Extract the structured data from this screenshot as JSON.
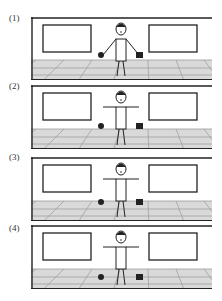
{
  "figure": {
    "panels": [
      {
        "label": "(1)",
        "top": 17,
        "height": 63,
        "labelTop": 13,
        "ballY": 38,
        "boxY": 38,
        "armsHolding": true
      },
      {
        "label": "(2)",
        "top": 85,
        "height": 64,
        "labelTop": 81,
        "ballY": 41,
        "boxY": 41,
        "armsHolding": false
      },
      {
        "label": "(3)",
        "top": 157,
        "height": 64,
        "labelTop": 152,
        "ballY": 45,
        "boxY": 45,
        "armsHolding": false
      },
      {
        "label": "(4)",
        "top": 225,
        "height": 64,
        "labelTop": 223,
        "ballY": 52,
        "boxY": 52,
        "armsHolding": false
      }
    ],
    "colors": {
      "line": "#222222",
      "floor": "#d9d9d9",
      "floorLine": "#9a9a9a",
      "wall": "#ffffff"
    }
  }
}
